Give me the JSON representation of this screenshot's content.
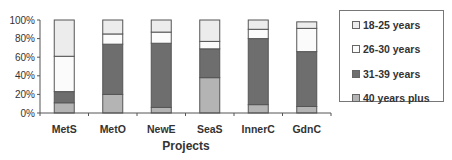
{
  "chart_data": {
    "type": "bar",
    "stacked": true,
    "title": "",
    "xlabel": "Projects",
    "ylabel": "",
    "ylim": [
      0,
      100
    ],
    "yticks": [
      "0%",
      "20%",
      "40%",
      "60%",
      "80%",
      "100%"
    ],
    "categories": [
      "MetS",
      "MetO",
      "NewE",
      "SeaS",
      "InnerC",
      "GdnC"
    ],
    "series": [
      {
        "name": "40 years plus",
        "color": "#b4b4b4",
        "values": [
          11,
          20,
          6,
          38,
          9,
          7
        ]
      },
      {
        "name": "31-39 years",
        "color": "#6e6e6e",
        "values": [
          12,
          54,
          69,
          31,
          71,
          59
        ]
      },
      {
        "name": "26-30 years",
        "color": "#fbfbfb",
        "values": [
          38,
          11,
          12,
          8,
          10,
          25
        ]
      },
      {
        "name": "18-25 years",
        "color": "#ececec",
        "values": [
          39,
          15,
          13,
          23,
          10,
          7
        ]
      }
    ],
    "legend_position": "right",
    "grid": false
  },
  "legend": {
    "items": [
      {
        "label": "18-25 years",
        "color": "#ececec"
      },
      {
        "label": "26-30 years",
        "color": "#fbfbfb"
      },
      {
        "label": "31-39 years",
        "color": "#6e6e6e"
      },
      {
        "label": "40 years plus",
        "color": "#b4b4b4"
      }
    ]
  }
}
